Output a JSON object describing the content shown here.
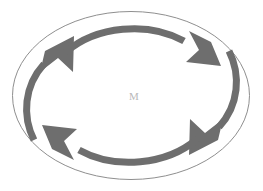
{
  "figure": {
    "name": "cyclic-arrow-diagram",
    "background_color": "#ffffff",
    "width": 263,
    "height": 191
  },
  "outer_ellipse": {
    "label": "outer boundary ellipse",
    "cx": 131,
    "cy": 95.5,
    "rx": 119,
    "ry": 84.5,
    "stroke_color": "#8f8f8f",
    "stroke_width": 1,
    "fill": "none"
  },
  "center": {
    "label": "M",
    "x": 134,
    "y": 97,
    "color": "#b9b9b9",
    "font_size": 11
  },
  "arrows": {
    "stroke_color": "#6e6e6e",
    "stroke_width": 7,
    "head_fill": "#6e6e6e",
    "items": [
      {
        "name": "arrow-top-left",
        "direction": "up-right",
        "description": "arc sweeping from lower-left up to upper-left, arrowhead pointing up and to the right",
        "tail_path": "M 30 133 C 22 108, 28 82, 46 64",
        "head_points": "68 42, 70 71, 58 61, 43 74, 45 57"
      },
      {
        "name": "arrow-top-right",
        "direction": "down-right",
        "description": "arc sweeping from upper-left across the top to the right, arrowhead pointing down and to the right",
        "tail_path": "M 68 50 C 96 26, 146 22, 182 40",
        "head_points": "213 62, 178 60, 191 50, 185 32, 205 41"
      },
      {
        "name": "arrow-bottom-right",
        "direction": "down-left",
        "description": "arc sweeping from upper-right down to the lower-right, arrowhead pointing down and to the left",
        "tail_path": "M 233 58 C 241 83, 235 109, 217 127"
      },
      {
        "name": "arrow-bottom-left",
        "direction": "up-left",
        "description": "arc sweeping from lower-right across the bottom to the left, arrowhead pointing up and to the left",
        "tail_path": "M 195 141 C 167 165, 117 169, 81 151"
      }
    ]
  }
}
